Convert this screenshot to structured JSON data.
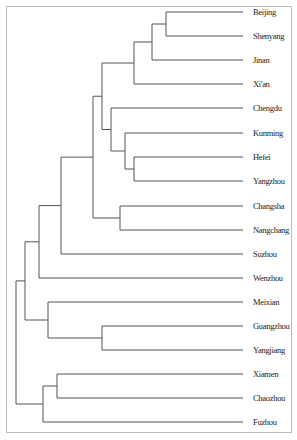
{
  "chart_data": {
    "type": "dendrogram",
    "title": "",
    "orientation": "horizontal, leaves on right",
    "leaves": [
      "Beijing",
      "Shenyang",
      "Jinan",
      "Xi'an",
      "Chengdu",
      "Kunming",
      "Hefei",
      "Yangzhou",
      "Changsha",
      "Nangchang",
      "Suzhou",
      "Wenzhou",
      "Meixian",
      "Guangzhou",
      "Yangjiang",
      "Xiamen",
      "Chaozhou",
      "Fuzhou"
    ],
    "leaf_y": [
      12,
      36,
      60,
      84,
      108,
      133,
      157,
      181,
      206,
      230,
      254,
      278,
      302,
      326,
      350,
      374,
      398,
      422
    ],
    "leaf_line_end_x": 243,
    "merges": [
      {
        "id": "A",
        "children": [
          "Beijing",
          "Shenyang"
        ],
        "x": 166
      },
      {
        "id": "B",
        "children": [
          "A",
          "Jinan"
        ],
        "x": 152
      },
      {
        "id": "C",
        "children": [
          "B",
          "Xi'an"
        ],
        "x": 134
      },
      {
        "id": "D",
        "children": [
          "Hefei",
          "Yangzhou"
        ],
        "x": 134
      },
      {
        "id": "E",
        "children": [
          "Kunming",
          "D"
        ],
        "x": 125
      },
      {
        "id": "F",
        "children": [
          "Chengdu",
          "E"
        ],
        "x": 111
      },
      {
        "id": "G",
        "children": [
          "C",
          "F"
        ],
        "x": 102
      },
      {
        "id": "H",
        "children": [
          "Changsha",
          "Nangchang"
        ],
        "x": 120
      },
      {
        "id": "I",
        "children": [
          "G",
          "H"
        ],
        "x": 93
      },
      {
        "id": "J",
        "children": [
          "I",
          "Suzhou"
        ],
        "x": 61
      },
      {
        "id": "K",
        "children": [
          "J",
          "Wenzhou"
        ],
        "x": 39
      },
      {
        "id": "L",
        "children": [
          "Guangzhou",
          "Yangjiang"
        ],
        "x": 102
      },
      {
        "id": "M",
        "children": [
          "Meixian",
          "L"
        ],
        "x": 48
      },
      {
        "id": "N",
        "children": [
          "K",
          "M"
        ],
        "x": 25
      },
      {
        "id": "O",
        "children": [
          "Xiamen",
          "Chaozhou"
        ],
        "x": 57
      },
      {
        "id": "P",
        "children": [
          "O",
          "Fuzhou"
        ],
        "x": 43
      },
      {
        "id": "root",
        "children": [
          "N",
          "P"
        ],
        "x": 16
      }
    ],
    "line_color": "#555555"
  }
}
